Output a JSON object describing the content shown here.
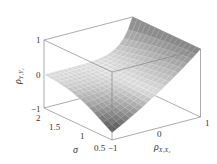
{
  "chart_data": {
    "type": "surface3d",
    "title": "",
    "xlabel": "ρ_{X1X2}",
    "ylabel": "σ",
    "zlabel": "ρ_{Y1Y2}",
    "x_ticks": [
      "-1",
      "0",
      "1"
    ],
    "y_ticks": [
      "0.5",
      "1",
      "1.5",
      "2"
    ],
    "z_ticks": [
      "-1",
      "0",
      "1"
    ],
    "xlim": [
      -1,
      1
    ],
    "ylim": [
      0.5,
      2
    ],
    "zlim": [
      -1,
      1
    ],
    "function": "(exp(rho*sigma^2)-1)/(exp(sigma^2)-1)",
    "grid": {
      "x_steps": 20,
      "y_steps": 15
    },
    "sample_values": [
      {
        "rho": -1,
        "sigma": 0.5,
        "z": -0.78
      },
      {
        "rho": 1,
        "sigma": 0.5,
        "z": 1
      },
      {
        "rho": -1,
        "sigma": 2,
        "z": -0.02
      },
      {
        "rho": 1,
        "sigma": 2,
        "z": 1
      },
      {
        "rho": 0,
        "sigma": 2,
        "z": 0
      }
    ],
    "colormap": "grayscale"
  },
  "labels": {
    "z_axis": {
      "main": "ρ",
      "sub": "Y₁Y₂"
    },
    "sigma_axis": "σ",
    "rho_axis": {
      "main": "ρ",
      "sub": "X₁X₂"
    },
    "z_ticks": [
      "1",
      "0",
      "−1"
    ],
    "sigma_ticks": [
      "2",
      "1.5",
      "1",
      "0.5"
    ],
    "rho_ticks": [
      "−1",
      "0",
      "1"
    ]
  }
}
